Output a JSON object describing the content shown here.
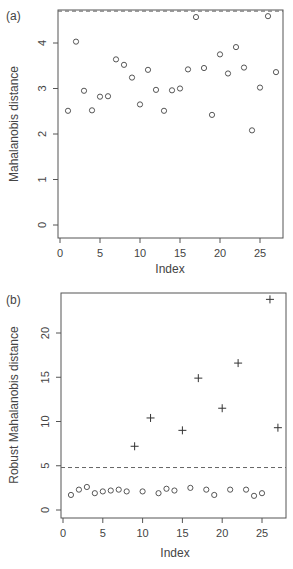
{
  "chart_data": [
    {
      "panel_label": "(a)",
      "type": "scatter",
      "xlabel": "Index",
      "ylabel": "Mahalanobis distance",
      "xlim": [
        0,
        28
      ],
      "ylim": [
        -0.2,
        4.75
      ],
      "xticks": [
        0,
        5,
        10,
        15,
        20,
        25
      ],
      "yticks": [
        0,
        1,
        2,
        3,
        4
      ],
      "grid": false,
      "marker": "circle",
      "cutoff_line": {
        "y": 4.7,
        "style": "dashed"
      },
      "x": [
        1,
        2,
        3,
        4,
        5,
        6,
        7,
        8,
        9,
        10,
        11,
        12,
        13,
        14,
        15,
        16,
        17,
        18,
        19,
        20,
        21,
        22,
        23,
        24,
        25,
        26,
        27
      ],
      "values": [
        2.51,
        4.03,
        2.95,
        2.52,
        2.82,
        2.83,
        3.64,
        3.52,
        3.24,
        2.65,
        3.41,
        2.97,
        2.51,
        2.96,
        3.0,
        3.42,
        4.57,
        3.45,
        2.42,
        3.75,
        3.33,
        3.91,
        3.46,
        2.08,
        3.02,
        4.59,
        3.36
      ]
    },
    {
      "panel_label": "(b)",
      "type": "scatter",
      "xlabel": "Index",
      "ylabel": "Robust Mahalanobis distance",
      "xlim": [
        0,
        28
      ],
      "ylim": [
        -1,
        25
      ],
      "xticks": [
        0,
        5,
        10,
        15,
        20,
        25
      ],
      "yticks": [
        0,
        5,
        10,
        15,
        20
      ],
      "grid": false,
      "cutoff_line": {
        "y": 4.8,
        "style": "dashed"
      },
      "series": [
        {
          "name": "regular",
          "marker": "circle",
          "x": [
            1,
            2,
            3,
            4,
            5,
            6,
            7,
            8,
            10,
            12,
            13,
            14,
            16,
            18,
            19,
            21,
            23,
            24,
            25
          ],
          "values": [
            1.7,
            2.3,
            2.6,
            1.9,
            2.1,
            2.2,
            2.3,
            2.1,
            2.1,
            1.9,
            2.4,
            2.2,
            2.5,
            2.3,
            1.7,
            2.3,
            2.3,
            1.6,
            1.9
          ]
        },
        {
          "name": "outliers",
          "marker": "plus",
          "x": [
            9,
            11,
            15,
            17,
            20,
            22,
            26,
            27
          ],
          "values": [
            7.2,
            10.4,
            9.0,
            14.9,
            11.5,
            16.6,
            23.8,
            9.3
          ]
        }
      ]
    }
  ],
  "labels": {
    "panel_a": "(a)",
    "panel_b": "(b)",
    "xlabel_a": "Index",
    "xlabel_b": "Index",
    "ylabel_a": "Mahalanobis distance",
    "ylabel_b": "Robust Mahalanobis distance"
  }
}
